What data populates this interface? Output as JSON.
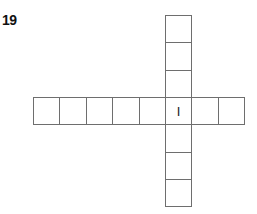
{
  "question": {
    "number": "19"
  },
  "grid": {
    "origin_x": 33,
    "origin_y": 15,
    "cell_w": 26.4,
    "cell_h": 27.3,
    "line_color": "#6e6e6e",
    "horizontal_word": {
      "row": 3,
      "start_col": 0,
      "length": 8
    },
    "vertical_word": {
      "col": 5,
      "start_row": 0,
      "length": 7
    },
    "given_letters": [
      {
        "row": 3,
        "col": 5,
        "letter": "I"
      }
    ]
  }
}
